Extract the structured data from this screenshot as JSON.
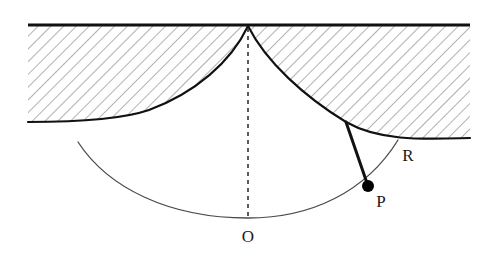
{
  "figure": {
    "background_color": "#ffffff",
    "width": 494,
    "height": 278
  },
  "colors": {
    "ink": "#1a1a1a",
    "heavy_stroke": "#111111",
    "thin_stroke": "#4a4a4a",
    "hatch": "#555555",
    "dashed": "#333333",
    "bob_fill": "#000000",
    "background": "#ffffff"
  },
  "labels": [
    {
      "id": "label-O",
      "text": "O",
      "x": 248,
      "y": 238,
      "describes": "lowest point of the pendulum swing arc, directly below the suspension cusp"
    },
    {
      "id": "label-P",
      "text": "P",
      "x": 381,
      "y": 203,
      "describes": "pendulum bob on the swing arc"
    },
    {
      "id": "label-R",
      "text": "R",
      "x": 408,
      "y": 157,
      "describes": "point where the swing arc meets the right cycloidal cheek"
    }
  ],
  "points": [
    {
      "id": "cusp",
      "name": "suspension-cusp",
      "x": 248,
      "y": 25,
      "marker": "none"
    },
    {
      "id": "bob",
      "name": "pendulum-bob-P",
      "x": 368,
      "y": 186,
      "marker": "filled-dot",
      "radius": 6
    },
    {
      "id": "tangent",
      "name": "tangent-point",
      "x": 346,
      "y": 122,
      "marker": "none"
    },
    {
      "id": "arc-bottom-O",
      "name": "arc-lowest-point",
      "x": 248,
      "y": 218,
      "marker": "none"
    },
    {
      "id": "arc-right-R",
      "name": "arc-endpoint-R",
      "x": 398,
      "y": 140,
      "marker": "none"
    }
  ],
  "elements": {
    "ceiling_line": {
      "name": "ceiling-line",
      "description": "horizontal heavy rule forming the top boundary of the hatched material",
      "x1": 28,
      "y1": 25,
      "x2": 470,
      "y2": 25,
      "stroke_width": 3
    },
    "left_cheek": {
      "name": "left-cycloidal-cheek-boundary",
      "description": "lower boundary of the left hatched cycloidal cheek, from cusp down-left",
      "path": "M 248 26 C 231 62 195 93 149 110 C 120 120 72 122 28 122",
      "stroke_width": 2.1
    },
    "right_cheek": {
      "name": "right-cycloidal-cheek-boundary",
      "description": "lower boundary of the right hatched cycloidal cheek, from cusp down-right, tangent to the string",
      "path": "M 248 26 C 266 62 305 97 346 122 C 381 142 427 139 470 138",
      "stroke_width": 2.1
    },
    "swing_arc": {
      "name": "pendulum-swing-arc",
      "description": "thin arc traced by the bob; passes through O at the bottom, through P, ending at R",
      "path": "M 78 142 C 108 188 169 218 248 218 C 311 218 366 192 398 140",
      "stroke_width": 1.3
    },
    "string": {
      "name": "pendulum-string",
      "description": "heavy line leaving the right cheek at the tangent point and running straight to the bob P",
      "x1": 346,
      "y1": 122,
      "x2": 368,
      "y2": 186,
      "stroke_width": 3
    },
    "plumb_line": {
      "name": "vertical-dashed-plumb-line",
      "description": "dashed vertical from the cusp down to O",
      "x1": 248,
      "y1": 28,
      "x2": 248,
      "y2": 218,
      "stroke_width": 1.6,
      "dash": "4 4"
    },
    "hatching": {
      "name": "material-hatching",
      "description": "45-degree hatch fill of the two cycloidal cheeks",
      "angle_deg": 45,
      "spacing_px": 9,
      "stroke_width": 0.9
    }
  }
}
